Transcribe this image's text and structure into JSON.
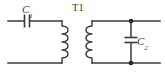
{
  "diagram": {
    "type": "schematic",
    "background_color": "#ffffff",
    "line_color": "#3a3a3a",
    "node_color": "#2b2b2b"
  },
  "components": {
    "c1": {
      "designator": "C",
      "index": "1",
      "kind": "capacitor",
      "orientation": "series-horizontal",
      "position": "top-left-branch"
    },
    "t1": {
      "designator": "T1",
      "kind": "transformer",
      "primary_turns_drawn": 4,
      "secondary_turns_drawn": 4,
      "core": "none"
    },
    "c2": {
      "designator": "C",
      "index": "2",
      "kind": "capacitor",
      "orientation": "shunt-vertical",
      "position": "right-branch"
    }
  },
  "nodes": {
    "top_right_junction": true,
    "bottom_right_junction": true
  }
}
